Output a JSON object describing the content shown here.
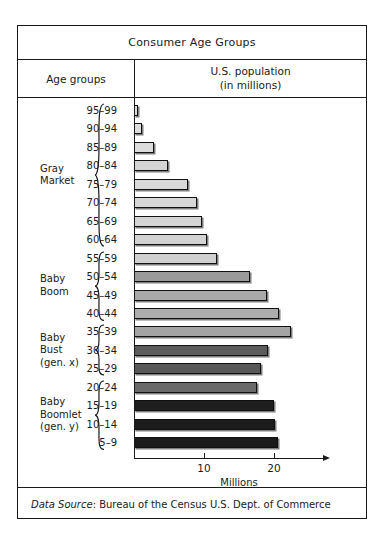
{
  "figure": {
    "title": "Consumer Age Groups",
    "column_headers": {
      "left": "Age groups",
      "right_line1": "U.S. population",
      "right_line2": "(in millions)"
    },
    "source_prefix": "Data Source",
    "source_rest": ": Bureau of the Census U.S. Dept. of Commerce"
  },
  "axis": {
    "title": "Millions",
    "ticks": [
      "10",
      "20"
    ],
    "tick_values": [
      10,
      20
    ],
    "min": 0,
    "max": 27
  },
  "groups": [
    {
      "name": "gray-market",
      "label_line1": "Gray",
      "label_line2": "Market",
      "label_line3": ""
    },
    {
      "name": "baby-boom",
      "label_line1": "Baby",
      "label_line2": "Boom",
      "label_line3": ""
    },
    {
      "name": "baby-bust",
      "label_line1": "Baby",
      "label_line2": "Bust",
      "label_line3": "(gen. x)"
    },
    {
      "name": "baby-boomlet",
      "label_line1": "Baby",
      "label_line2": "Boomlet",
      "label_line3": "(gen. y)"
    }
  ],
  "chart_data": {
    "type": "bar",
    "orientation": "horizontal",
    "title": "Consumer Age Groups",
    "xlabel": "Millions",
    "ylabel": "Age groups",
    "xlim": [
      0,
      27
    ],
    "grid": false,
    "legend": false,
    "categories": [
      "95–99",
      "90–94",
      "85–89",
      "80–84",
      "75–79",
      "70–74",
      "65–69",
      "60–64",
      "55–59",
      "50–54",
      "45–49",
      "40–44",
      "35–39",
      "30–34",
      "25–29",
      "20–24",
      "15–19",
      "10–14",
      "5–9"
    ],
    "values": [
      0.6,
      1.1,
      2.8,
      4.8,
      7.7,
      9.0,
      9.7,
      10.4,
      11.9,
      16.6,
      19.0,
      20.7,
      22.4,
      19.1,
      18.2,
      17.6,
      20.0,
      20.2,
      20.5
    ],
    "group_of": [
      "gray-market",
      "gray-market",
      "gray-market",
      "gray-market",
      "gray-market",
      "gray-market",
      "gray-market",
      "gray-market",
      "baby-boom",
      "baby-boom",
      "baby-boom",
      "baby-boom",
      "baby-bust",
      "baby-bust",
      "baby-bust",
      "baby-boomlet",
      "baby-boomlet",
      "baby-boomlet",
      "baby-boomlet"
    ],
    "colors": [
      "#dcdcdc",
      "#dcdcdc",
      "#dcdcdc",
      "#d4d4d4",
      "#d8d8d8",
      "#d6d6d6",
      "#d4d4d4",
      "#d2d2d2",
      "#d0d0d0",
      "#9a9a9a",
      "#a8a8a8",
      "#aeaeae",
      "#a4a4a4",
      "#5c5c5c",
      "#585858",
      "#6a6a6a",
      "#1e1e1e",
      "#1c1c1c",
      "#1a1a1a"
    ]
  }
}
